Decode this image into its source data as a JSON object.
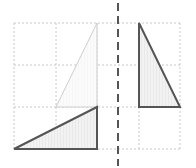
{
  "diagram": {
    "type": "geometry-transformation",
    "grid": {
      "x_lines": [
        14,
        56,
        97,
        139,
        180
      ],
      "y_lines": [
        23,
        65,
        107,
        149
      ],
      "x_min": 14,
      "x_max": 180,
      "y_min": 23,
      "y_max": 149,
      "cell_size": 42,
      "color": "#c8c8c8",
      "dash": "2 2"
    },
    "axis": {
      "orientation": "vertical",
      "x": 118,
      "y_start": 3,
      "y_end": 166,
      "color": "#555555",
      "dash": "8 5",
      "width": 2
    },
    "shapes": [
      {
        "name": "faint-triangle",
        "points": [
          [
            56,
            107
          ],
          [
            97,
            107
          ],
          [
            97,
            23
          ]
        ],
        "stroke": "#cfcfcf",
        "fill": "#fafafa",
        "stroke_width": 1
      },
      {
        "name": "bottom-left-triangle",
        "points": [
          [
            14,
            149
          ],
          [
            97,
            149
          ],
          [
            97,
            107
          ]
        ],
        "stroke": "#555555",
        "fill": "#ececec",
        "stroke_width": 2
      },
      {
        "name": "right-triangle",
        "points": [
          [
            139,
            23
          ],
          [
            139,
            107
          ],
          [
            180,
            107
          ]
        ],
        "stroke": "#555555",
        "fill": "#ececec",
        "stroke_width": 2
      }
    ]
  }
}
